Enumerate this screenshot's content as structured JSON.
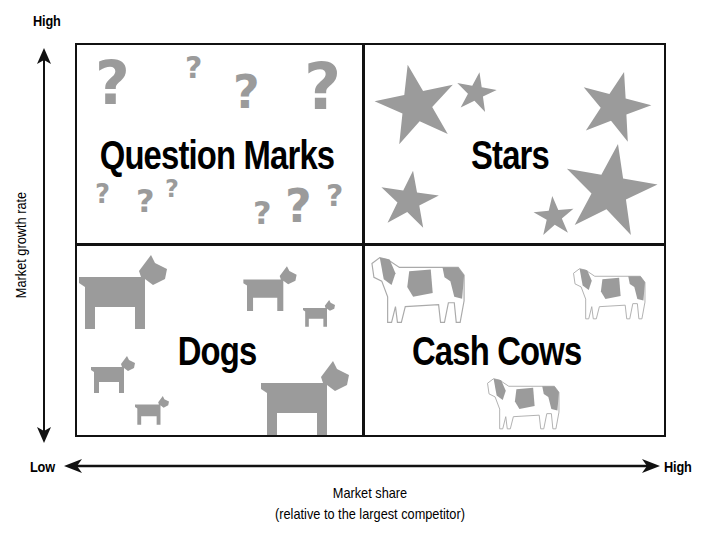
{
  "y_axis": {
    "high_label": "High",
    "title": "Market growth rate"
  },
  "x_axis": {
    "low_label": "Low",
    "high_label": "High",
    "title": "Market share",
    "subtitle": "(relative to the largest competitor)"
  },
  "quadrants": {
    "top_left": {
      "label": "Question Marks",
      "icon": "question-mark-icon",
      "icon_count": 10
    },
    "top_right": {
      "label": "Stars",
      "icon": "star-icon",
      "icon_count": 6
    },
    "bottom_left": {
      "label": "Dogs",
      "icon": "dog-icon",
      "icon_count": 6
    },
    "bottom_right": {
      "label": "Cash Cows",
      "icon": "cow-icon",
      "icon_count": 3
    }
  },
  "question_mark_glyph": "?",
  "colors": {
    "icon_gray": "#9b9b9b",
    "line": "#111111",
    "background": "#ffffff"
  }
}
